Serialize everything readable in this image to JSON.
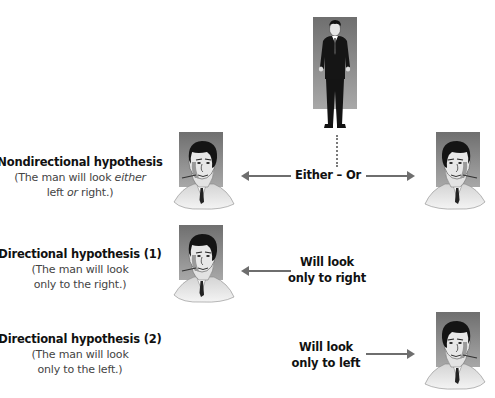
{
  "diagram": {
    "type": "hypothesis-direction-illustration",
    "walking_man": {
      "icon": "walking-man-figure"
    },
    "rows": [
      {
        "title": "Nondirectional hypothesis",
        "sub_line1_pre": "(The man will look ",
        "sub_line1_em": "either",
        "sub_line2_pre": "left ",
        "sub_line2_em": "or",
        "sub_line2_post": " right.)",
        "center_text": "Either – Or",
        "arrows": [
          "left",
          "right"
        ],
        "portraits": [
          "left",
          "right"
        ]
      },
      {
        "title": "Directional hypothesis (1)",
        "sub_line1": "(The man will look",
        "sub_line2": "only to the right.)",
        "center_line1": "Will look",
        "center_line2": "only to right",
        "arrows": [
          "left"
        ],
        "portraits": [
          "left"
        ]
      },
      {
        "title": "Directional hypothesis (2)",
        "sub_line1": "(The man will look",
        "sub_line2": "only to the left.)",
        "center_line1": "Will look",
        "center_line2": "only to left",
        "arrows": [
          "right"
        ],
        "portraits": [
          "right"
        ]
      }
    ],
    "colors": {
      "arrow": "#6e6e6e",
      "portrait_bg": "#8a8a8a",
      "text": "#111111",
      "subtext": "#444444"
    }
  }
}
